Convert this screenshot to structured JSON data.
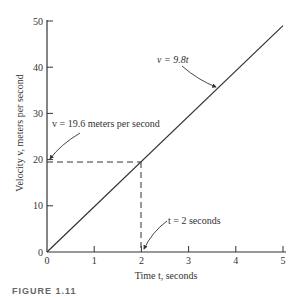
{
  "chart_data": {
    "type": "line",
    "title": "",
    "xlabel": "Time t, seconds",
    "ylabel": "Velocity v, meters per second",
    "xlim": [
      0,
      5
    ],
    "ylim": [
      0,
      50
    ],
    "x_ticks": [
      "0",
      "1",
      "2",
      "3",
      "4",
      "5"
    ],
    "y_ticks": [
      "0",
      "10",
      "20",
      "30",
      "40",
      "50"
    ],
    "grid": false,
    "series": [
      {
        "name": "v = 9.8t",
        "x": [
          0,
          5
        ],
        "y": [
          0,
          49
        ]
      }
    ],
    "reference_lines": [
      {
        "type": "horizontal-dashed",
        "y": 19.6,
        "x_range": [
          0,
          2
        ]
      },
      {
        "type": "vertical-dashed",
        "x": 2,
        "y_range": [
          0,
          19.6
        ]
      }
    ],
    "annotations": [
      {
        "text": "v = 9.8t",
        "points_to": [
          3.8,
          37.2
        ]
      },
      {
        "text": "v = 19.6 meters per second",
        "points_to": [
          0,
          19.6
        ]
      },
      {
        "text": "t = 2 seconds",
        "points_to": [
          2,
          0
        ]
      }
    ]
  },
  "labels": {
    "xlabel": "Time t, seconds",
    "ylabel": "Velocity v, meters per second",
    "annot_eq": "v = 9.8t",
    "annot_v": "v = 19.6 meters per second",
    "annot_t": "t = 2 seconds",
    "caption": "FIGURE 1.11"
  }
}
